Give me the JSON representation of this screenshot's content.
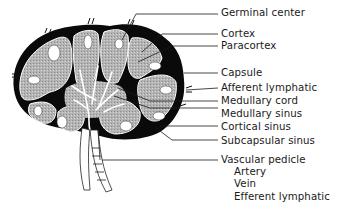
{
  "diagram": {
    "labels": [
      {
        "id": "germinal-center",
        "text": "Germinal center",
        "x": 221,
        "y": 9
      },
      {
        "id": "cortex",
        "text": "Cortex",
        "x": 221,
        "y": 29
      },
      {
        "id": "paracortex",
        "text": "Paracortex",
        "x": 221,
        "y": 41
      },
      {
        "id": "capsule",
        "text": "Capsule",
        "x": 221,
        "y": 67
      },
      {
        "id": "afferent-lymphatic",
        "text": "Afferent lymphatic",
        "x": 221,
        "y": 82
      },
      {
        "id": "medullary-cord",
        "text": "Medullary cord",
        "x": 221,
        "y": 94
      },
      {
        "id": "medullary-sinus",
        "text": "Medullary sinus",
        "x": 221,
        "y": 108
      },
      {
        "id": "cortical-sinus",
        "text": "Cortical sinus",
        "x": 221,
        "y": 122
      },
      {
        "id": "subcapsular-sinus",
        "text": "Subcapsular sinus",
        "x": 221,
        "y": 136
      },
      {
        "id": "vascular-pedicle",
        "text": "Vascular pedicle",
        "x": 221,
        "y": 153
      },
      {
        "id": "artery",
        "text": "Artery",
        "x": 232,
        "y": 166
      },
      {
        "id": "vein",
        "text": "Vein",
        "x": 232,
        "y": 178
      },
      {
        "id": "efferent-lymphatic",
        "text": "Efferent lymphatic",
        "x": 232,
        "y": 190
      }
    ],
    "colors": {
      "capsule": "#0a0a0a",
      "cortex": "#a9a9a9",
      "sinus": "#ffffff",
      "line": "#1a1a1a"
    }
  }
}
